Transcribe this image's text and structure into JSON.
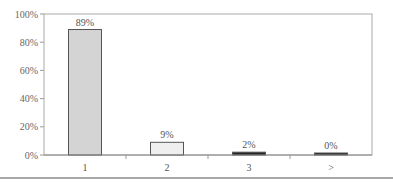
{
  "chart_data": {
    "type": "bar",
    "title": "",
    "xlabel": "",
    "ylabel": "",
    "categories": [
      "1",
      "2",
      "3",
      ">"
    ],
    "values": [
      89,
      9,
      2,
      0
    ],
    "value_labels": [
      "89%",
      "9%",
      "2%",
      "0%"
    ],
    "bar_colors": [
      "#d4d4d4",
      "#efefef",
      "#222222",
      "#222222"
    ],
    "ylim": [
      0,
      100
    ],
    "yticks": [
      0,
      20,
      40,
      60,
      80,
      100
    ],
    "ytick_labels": [
      "0%",
      "20%",
      "40%",
      "60%",
      "80%",
      "100%"
    ],
    "grid": false,
    "legend": null
  },
  "colors": {
    "axis": "#999999",
    "frame": "#aaaaaa",
    "bottom_rule": "#555555"
  }
}
